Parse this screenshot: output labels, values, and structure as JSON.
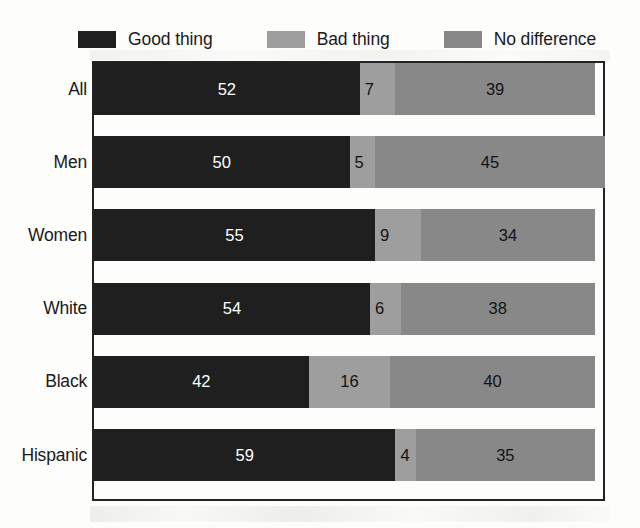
{
  "legend": {
    "items": [
      {
        "label": "Good thing",
        "swatch_name": "legend-swatch-good-thing",
        "color": "#1f1f1f"
      },
      {
        "label": "Bad thing",
        "swatch_name": "legend-swatch-bad-thing",
        "color": "#9e9e9e"
      },
      {
        "label": "No difference",
        "swatch_name": "legend-swatch-no-difference",
        "color": "#888888"
      }
    ]
  },
  "chart_data": {
    "type": "bar",
    "orientation": "horizontal",
    "stacked": true,
    "title": "",
    "subtitle": "",
    "xlabel": "",
    "ylabel": "",
    "xlim": [
      0,
      100
    ],
    "grid": false,
    "legend_position": "top",
    "categories": [
      "All",
      "Men",
      "Women",
      "White",
      "Black",
      "Hispanic"
    ],
    "series": [
      {
        "name": "Good thing",
        "color": "#1f1f1f",
        "values": [
          52,
          50,
          55,
          54,
          42,
          59
        ]
      },
      {
        "name": "Bad thing",
        "color": "#9e9e9e",
        "values": [
          7,
          5,
          9,
          6,
          16,
          4
        ]
      },
      {
        "name": "No difference",
        "color": "#888888",
        "values": [
          39,
          45,
          34,
          38,
          40,
          35
        ]
      }
    ],
    "row_totals": [
      98,
      100,
      98,
      98,
      98,
      98
    ],
    "rows": [
      {
        "label": "All",
        "good": 52,
        "bad": 7,
        "nodiff": 39
      },
      {
        "label": "Men",
        "good": 50,
        "bad": 5,
        "nodiff": 45
      },
      {
        "label": "Women",
        "good": 55,
        "bad": 9,
        "nodiff": 34
      },
      {
        "label": "White",
        "good": 54,
        "bad": 6,
        "nodiff": 38
      },
      {
        "label": "Black",
        "good": 42,
        "bad": 16,
        "nodiff": 40
      },
      {
        "label": "Hispanic",
        "good": 59,
        "bad": 4,
        "nodiff": 35
      }
    ]
  },
  "style": {
    "background": "#fdfdfb",
    "frame_color": "#232323",
    "text_color": "#1a1a1a",
    "value_on_dark_color": "#ffffff",
    "value_on_gray_color": "#121212"
  }
}
